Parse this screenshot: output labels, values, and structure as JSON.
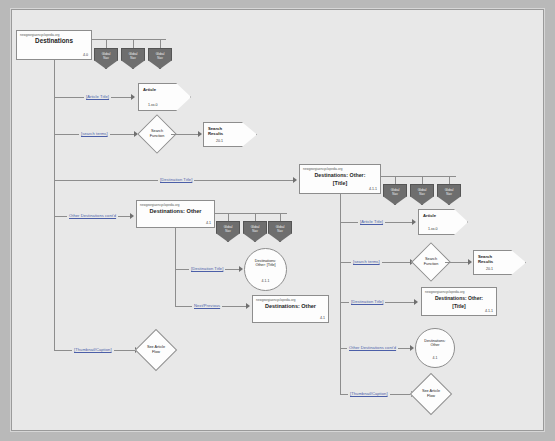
{
  "diagram": {
    "url_label": "newgeorgiaencyclopedia.org",
    "colors": {
      "canvas": "#e8e8e8",
      "page_margin": "#b9b9b9",
      "node_fill": "#fdfdfd",
      "node_stroke": "#8d8d8d",
      "link_text": "#4b5fa8",
      "shield_fill": "#6e6e6e"
    }
  },
  "nodes": {
    "destinations_root": {
      "url": "newgeorgiaencyclopedia.org",
      "title": "Destinations",
      "number": "4.0"
    },
    "destinations_other_left": {
      "url": "newgeorgiaencyclopedia.org",
      "title": "Destinations: Other",
      "number": "4.1"
    },
    "destinations_other_title_center": {
      "url": "newgeorgiaencyclopedia.org",
      "title": "Destinations: Other: [Title]",
      "number": "4.1.1"
    },
    "destinations_other_nextprev": {
      "url": "newgeorgiaencyclopedia.org",
      "title": "Destinations: Other",
      "number": "4.1"
    },
    "destinations_other_title_right": {
      "url": "newgeorgiaencyclopedia.org",
      "title": "Destinations: Other: [Title]",
      "number": "4.1.1"
    },
    "article_left": {
      "title": "Article",
      "number": "1.xx.0"
    },
    "article_right": {
      "title": "Article",
      "number": "1.xx.0"
    },
    "search_results_left": {
      "title": "Search Results",
      "number": "20.1"
    },
    "search_results_right": {
      "title": "Search Results",
      "number": "20.1"
    },
    "search_function_left": {
      "title": "Search Function"
    },
    "search_function_right": {
      "title": "Search Function"
    },
    "see_article_flow_left": {
      "title": "See Article Flow"
    },
    "see_article_flow_right": {
      "title": "See Article Flow"
    },
    "circle_other_title": {
      "title": "Destinations: Other: [Title]",
      "number": "4.1.1"
    },
    "circle_other": {
      "title": "Destinations: Other",
      "number": "4.1"
    }
  },
  "shields": {
    "label_line1": "Global",
    "label_line2": "Nav",
    "top_group": [
      "Global Nav",
      "Global Nav",
      "Global Nav"
    ],
    "mid_group": [
      "Global Nav",
      "Global Nav",
      "Global Nav"
    ],
    "center_group": [
      "Global Nav",
      "Global Nav",
      "Global Nav"
    ]
  },
  "links": {
    "article_title": "[Article Title]",
    "search_terms": "[search terms]",
    "destination_title": "[Destination Title]",
    "other_destinations": "Other Destinations cont'd",
    "next_previous": "Next/Previous",
    "thumbnail_caption": "[Thumbnail/Caption]"
  }
}
